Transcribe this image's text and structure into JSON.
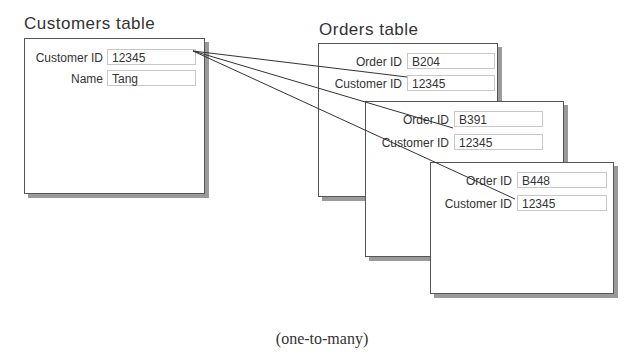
{
  "customers": {
    "title": "Customers table",
    "fields": [
      {
        "label": "Customer ID",
        "value": "12345"
      },
      {
        "label": "Name",
        "value": "Tang"
      }
    ]
  },
  "orders": {
    "title": "Orders table",
    "records": [
      {
        "order_id_label": "Order ID",
        "order_id": "B204",
        "customer_id_label": "Customer ID",
        "customer_id": "12345"
      },
      {
        "order_id_label": "Order ID",
        "order_id": "B391",
        "customer_id_label": "Customer ID",
        "customer_id": "12345"
      },
      {
        "order_id_label": "Order ID",
        "order_id": "B448",
        "customer_id_label": "Customer ID",
        "customer_id": "12345"
      }
    ]
  },
  "relationship": "one-to-many",
  "caption": "(one-to-many)"
}
